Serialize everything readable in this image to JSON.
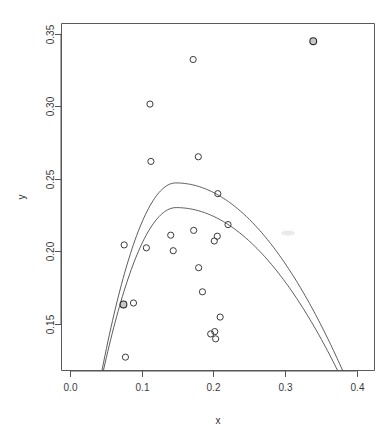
{
  "chart_data": {
    "type": "scatter",
    "title": "",
    "subtitle": "",
    "xlabel": "x",
    "ylabel": "y",
    "xlim": [
      -0.012,
      0.425
    ],
    "ylim": [
      0.118,
      0.357
    ],
    "grid": false,
    "legend": null,
    "legend_position": "none",
    "xticks": [
      0.0,
      0.1,
      0.2,
      0.3,
      0.4
    ],
    "xticklabels": [
      "0.0",
      "0.1",
      "0.2",
      "0.3",
      "0.4"
    ],
    "yticks": [
      0.15,
      0.2,
      0.25,
      0.3,
      0.35
    ],
    "yticklabels": [
      "0.15",
      "0.20",
      "0.25",
      "0.30",
      "0.35"
    ],
    "point_marker": "open-circle",
    "points": [
      {
        "x": 0.0745,
        "y": 0.1635,
        "highlight": true
      },
      {
        "x": 0.0755,
        "y": 0.2045,
        "highlight": false
      },
      {
        "x": 0.0773,
        "y": 0.1272,
        "highlight": false
      },
      {
        "x": 0.0885,
        "y": 0.1645,
        "highlight": false
      },
      {
        "x": 0.1065,
        "y": 0.2025,
        "highlight": false
      },
      {
        "x": 0.1115,
        "y": 0.3015,
        "highlight": false
      },
      {
        "x": 0.1128,
        "y": 0.262,
        "highlight": false
      },
      {
        "x": 0.1405,
        "y": 0.2112,
        "highlight": false
      },
      {
        "x": 0.144,
        "y": 0.2005,
        "highlight": false
      },
      {
        "x": 0.1718,
        "y": 0.3322,
        "highlight": false
      },
      {
        "x": 0.1725,
        "y": 0.2145,
        "highlight": false
      },
      {
        "x": 0.179,
        "y": 0.2652,
        "highlight": false
      },
      {
        "x": 0.1795,
        "y": 0.1888,
        "highlight": false
      },
      {
        "x": 0.1848,
        "y": 0.1722,
        "highlight": false
      },
      {
        "x": 0.1963,
        "y": 0.1432,
        "highlight": false
      },
      {
        "x": 0.2013,
        "y": 0.2072,
        "highlight": false
      },
      {
        "x": 0.202,
        "y": 0.1448,
        "highlight": false
      },
      {
        "x": 0.2032,
        "y": 0.1398,
        "highlight": false
      },
      {
        "x": 0.2055,
        "y": 0.2105,
        "highlight": false
      },
      {
        "x": 0.2062,
        "y": 0.2398,
        "highlight": false
      },
      {
        "x": 0.2095,
        "y": 0.1548,
        "highlight": false
      },
      {
        "x": 0.2205,
        "y": 0.2185,
        "highlight": false
      },
      {
        "x": 0.3395,
        "y": 0.3448,
        "highlight": true
      }
    ],
    "curves": [
      {
        "name": "quadratic-fit-upper",
        "shape": "parabola",
        "vertex_x": 0.1475,
        "vertex_y": 0.2472,
        "x_start": 0.0445,
        "x_end": 0.3805,
        "note": "fit including the high-leverage point"
      },
      {
        "name": "quadratic-fit-lower",
        "shape": "parabola",
        "vertex_x": 0.148,
        "vertex_y": 0.2302,
        "x_start": 0.0465,
        "x_end": 0.3735,
        "note": "fit excluding the high-leverage point"
      }
    ],
    "annotations": []
  },
  "axes": {
    "x_title": "x",
    "y_title": "y"
  }
}
